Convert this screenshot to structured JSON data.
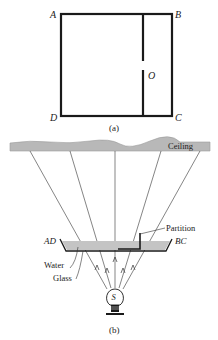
{
  "figure_a": {
    "caption": "(a)",
    "corners": {
      "top_left": "A",
      "top_right": "B",
      "bottom_right": "C",
      "bottom_left": "D"
    },
    "gap_label": "O"
  },
  "figure_b": {
    "caption": "(b)",
    "ceiling_label": "Ceiling",
    "partition_label": "Partition",
    "left_edge_label": "AD",
    "right_edge_label": "BC",
    "water_label": "Water",
    "glass_label": "Glass",
    "source_label": "S"
  },
  "colors": {
    "ink": "#1a1a1a",
    "ceiling_fill": "#b8b8b8",
    "water_fill": "#c4c4c4"
  }
}
